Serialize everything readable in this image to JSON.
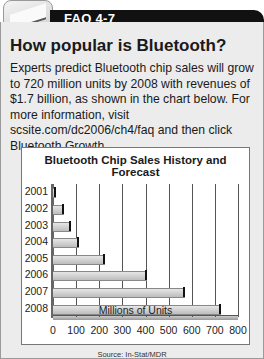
{
  "header": {
    "tab_label": "FAQ 4-7",
    "icon": "document-icon"
  },
  "content": {
    "title": "How popular is Bluetooth?",
    "description": "Experts predict Bluetooth chip sales will grow to 720 million units by 2008 with revenues of $1.7 billion, as shown in the chart below. For more information, visit scsite.com/dc2006/ch4/faq and then click Bluetooth Growth."
  },
  "chart_data": {
    "type": "bar",
    "orientation": "horizontal",
    "title": "Bluetooth Chip Sales History and Forecast",
    "categories": [
      "2001",
      "2002",
      "2003",
      "2004",
      "2005",
      "2006",
      "2007",
      "2008"
    ],
    "values": [
      10,
      45,
      75,
      110,
      220,
      400,
      565,
      720
    ],
    "xlabel": "Millions of Units",
    "ylabel": "",
    "xlim": [
      0,
      800
    ],
    "xticks": [
      "0",
      "100",
      "200",
      "300",
      "400",
      "500",
      "600",
      "700",
      "800"
    ],
    "grid": true,
    "source": "Source: In-Stat/MDR"
  }
}
